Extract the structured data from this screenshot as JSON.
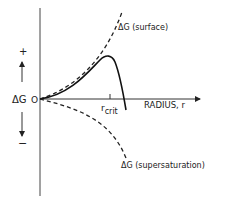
{
  "diagram": {
    "y_axis": {
      "label": "ΔG",
      "positive_sign": "+",
      "negative_sign": "−",
      "origin_label": "O"
    },
    "x_axis": {
      "label": "RADIUS, r",
      "critical_tick_label_main": "r",
      "critical_tick_label_sub": "crit"
    },
    "curves": [
      {
        "name": "surface",
        "label": "ΔG (surface)",
        "style": "dashed",
        "trend": "increasing"
      },
      {
        "name": "total",
        "label": "",
        "style": "solid",
        "trend": "rises to maximum at r_crit then falls"
      },
      {
        "name": "supersaturation",
        "label": "ΔG (supersaturation)",
        "style": "dashed",
        "trend": "decreasing"
      }
    ],
    "colors": {
      "ink": "#222222",
      "background": "#ffffff"
    }
  }
}
